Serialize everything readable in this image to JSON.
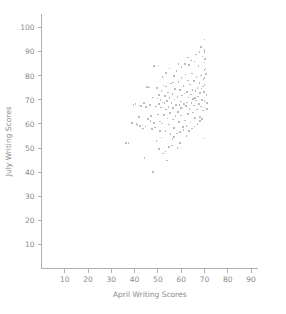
{
  "chart_data": {
    "type": "scatter",
    "title": "",
    "xlabel": "April Writing Scores",
    "ylabel": "July Writing Scores",
    "xlim": [
      0,
      93
    ],
    "ylim": [
      0,
      104
    ],
    "xticks": [
      10,
      20,
      30,
      40,
      50,
      60,
      70,
      80,
      90
    ],
    "yticks": [
      10,
      20,
      30,
      40,
      50,
      60,
      70,
      80,
      90,
      100
    ],
    "xtick_labels": [
      "10",
      "20",
      "30",
      "40",
      "50",
      "60",
      "70",
      "80",
      "90"
    ],
    "ytick_labels": [
      "10",
      "20",
      "30",
      "40",
      "50",
      "60",
      "70",
      "80",
      "90",
      "100"
    ],
    "grid": false,
    "legend": false,
    "legend_position": "none",
    "marker_color": "#bcbcbc",
    "axis_color": "#b0b0b0",
    "text_color": "#8a8a8a",
    "marker_size": 1.6,
    "series": [
      {
        "name": "students",
        "points": [
          [
            36.2,
            52.0
          ],
          [
            37.4,
            52.0
          ],
          [
            39.0,
            60.5
          ],
          [
            39.6,
            67.8
          ],
          [
            40.4,
            68.2
          ],
          [
            40.8,
            60.0
          ],
          [
            41.2,
            59.6
          ],
          [
            41.6,
            67.6
          ],
          [
            42.0,
            63.0
          ],
          [
            42.4,
            59.2
          ],
          [
            42.8,
            67.4
          ],
          [
            43.4,
            58.0
          ],
          [
            43.8,
            58.2
          ],
          [
            44.2,
            46.0
          ],
          [
            44.6,
            59.0
          ],
          [
            45.0,
            67.0
          ],
          [
            45.4,
            75.4
          ],
          [
            45.8,
            62.0
          ],
          [
            46.2,
            75.2
          ],
          [
            46.6,
            68.0
          ],
          [
            47.0,
            63.4
          ],
          [
            47.4,
            57.8
          ],
          [
            47.8,
            71.0
          ],
          [
            48.0,
            40.0
          ],
          [
            48.4,
            84.0
          ],
          [
            48.8,
            58.6
          ],
          [
            49.2,
            67.2
          ],
          [
            49.6,
            75.0
          ],
          [
            49.8,
            70.6
          ],
          [
            50.0,
            64.0
          ],
          [
            50.2,
            84.2
          ],
          [
            50.4,
            72.0
          ],
          [
            50.6,
            68.4
          ],
          [
            50.8,
            61.0
          ],
          [
            51.0,
            57.0
          ],
          [
            51.2,
            70.0
          ],
          [
            51.4,
            66.8
          ],
          [
            51.6,
            73.8
          ],
          [
            51.8,
            60.2
          ],
          [
            52.0,
            69.0
          ],
          [
            52.2,
            47.8
          ],
          [
            52.4,
            76.0
          ],
          [
            52.6,
            63.8
          ],
          [
            52.8,
            68.6
          ],
          [
            53.0,
            71.6
          ],
          [
            53.2,
            57.2
          ],
          [
            53.4,
            66.0
          ],
          [
            53.6,
            75.6
          ],
          [
            53.8,
            69.6
          ],
          [
            54.0,
            44.8
          ],
          [
            54.2,
            62.2
          ],
          [
            54.4,
            73.0
          ],
          [
            54.6,
            67.0
          ],
          [
            54.8,
            59.8
          ],
          [
            55.0,
            70.8
          ],
          [
            55.2,
            64.6
          ],
          [
            55.4,
            55.8
          ],
          [
            55.6,
            76.8
          ],
          [
            55.8,
            68.8
          ],
          [
            56.0,
            51.0
          ],
          [
            56.2,
            72.4
          ],
          [
            56.4,
            61.8
          ],
          [
            56.6,
            66.6
          ],
          [
            56.8,
            80.0
          ],
          [
            57.0,
            58.4
          ],
          [
            57.2,
            70.2
          ],
          [
            57.4,
            74.6
          ],
          [
            57.6,
            63.2
          ],
          [
            57.8,
            67.8
          ],
          [
            58.0,
            82.0
          ],
          [
            58.2,
            56.0
          ],
          [
            58.4,
            71.2
          ],
          [
            58.6,
            65.0
          ],
          [
            58.8,
            77.4
          ],
          [
            59.0,
            60.8
          ],
          [
            59.2,
            68.0
          ],
          [
            59.4,
            74.0
          ],
          [
            59.6,
            52.0
          ],
          [
            59.8,
            69.4
          ],
          [
            60.0,
            63.6
          ],
          [
            60.2,
            79.0
          ],
          [
            60.4,
            71.8
          ],
          [
            60.6,
            66.4
          ],
          [
            60.8,
            58.8
          ],
          [
            61.0,
            75.8
          ],
          [
            61.2,
            68.2
          ],
          [
            61.4,
            72.6
          ],
          [
            61.6,
            61.4
          ],
          [
            61.8,
            80.6
          ],
          [
            62.0,
            67.4
          ],
          [
            62.2,
            55.0
          ],
          [
            62.4,
            73.4
          ],
          [
            62.6,
            69.0
          ],
          [
            62.8,
            78.0
          ],
          [
            63.0,
            64.2
          ],
          [
            63.2,
            71.0
          ],
          [
            63.4,
            84.6
          ],
          [
            63.6,
            66.2
          ],
          [
            63.8,
            76.4
          ],
          [
            64.0,
            60.6
          ],
          [
            64.2,
            72.2
          ],
          [
            64.4,
            68.6
          ],
          [
            64.6,
            81.0
          ],
          [
            64.8,
            74.2
          ],
          [
            65.0,
            64.8
          ],
          [
            65.2,
            70.4
          ],
          [
            65.4,
            77.8
          ],
          [
            65.6,
            67.6
          ],
          [
            65.8,
            86.0
          ],
          [
            66.0,
            62.6
          ],
          [
            66.2,
            73.6
          ],
          [
            66.4,
            69.8
          ],
          [
            66.6,
            79.6
          ],
          [
            66.8,
            66.0
          ],
          [
            67.0,
            75.0
          ],
          [
            67.2,
            71.4
          ],
          [
            67.4,
            84.0
          ],
          [
            67.6,
            68.4
          ],
          [
            67.8,
            77.0
          ],
          [
            68.0,
            63.0
          ],
          [
            68.2,
            72.8
          ],
          [
            68.4,
            80.2
          ],
          [
            68.6,
            67.2
          ],
          [
            68.8,
            74.8
          ],
          [
            69.0,
            70.0
          ],
          [
            69.2,
            88.0
          ],
          [
            69.4,
            65.6
          ],
          [
            69.6,
            78.6
          ],
          [
            69.8,
            73.2
          ],
          [
            70.0,
            95.0
          ],
          [
            70.0,
            90.6
          ],
          [
            70.0,
            89.8
          ],
          [
            70.0,
            85.6
          ],
          [
            70.0,
            82.4
          ],
          [
            70.0,
            79.2
          ],
          [
            70.0,
            76.2
          ],
          [
            70.0,
            73.0
          ],
          [
            70.0,
            69.6
          ],
          [
            70.0,
            66.8
          ],
          [
            70.0,
            54.0
          ],
          [
            70.2,
            87.0
          ],
          [
            70.4,
            83.0
          ],
          [
            70.6,
            80.8
          ],
          [
            70.8,
            72.0
          ],
          [
            71.0,
            68.8
          ],
          [
            71.2,
            66.2
          ],
          [
            49.4,
            53.0
          ],
          [
            50.6,
            49.6
          ],
          [
            53.2,
            48.6
          ],
          [
            54.8,
            50.4
          ],
          [
            56.2,
            53.8
          ],
          [
            57.0,
            54.6
          ],
          [
            58.4,
            50.0
          ],
          [
            59.4,
            56.6
          ],
          [
            61.0,
            57.6
          ],
          [
            62.2,
            59.2
          ],
          [
            63.4,
            57.0
          ],
          [
            64.6,
            58.2
          ],
          [
            65.8,
            59.0
          ],
          [
            67.0,
            60.0
          ],
          [
            68.2,
            61.2
          ],
          [
            69.0,
            62.0
          ],
          [
            52.0,
            79.4
          ],
          [
            53.6,
            81.2
          ],
          [
            55.0,
            83.0
          ],
          [
            56.4,
            77.2
          ],
          [
            58.8,
            84.8
          ],
          [
            60.2,
            83.6
          ],
          [
            61.6,
            85.0
          ],
          [
            63.0,
            87.6
          ],
          [
            64.2,
            86.4
          ],
          [
            66.4,
            88.8
          ],
          [
            67.8,
            90.0
          ],
          [
            68.6,
            92.0
          ],
          [
            44.0,
            68.6
          ],
          [
            46.8,
            61.2
          ],
          [
            48.2,
            60.4
          ],
          [
            51.6,
            54.4
          ],
          [
            59.8,
            66.6
          ],
          [
            62.8,
            64.0
          ],
          [
            66.0,
            70.8
          ],
          [
            69.4,
            75.6
          ]
        ]
      }
    ]
  },
  "axes": {
    "x_title": "April Writing Scores",
    "y_title": "July Writing Scores"
  }
}
